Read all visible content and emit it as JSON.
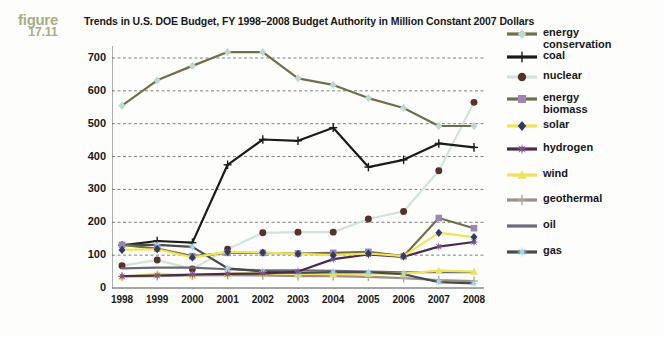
{
  "figure": {
    "word": "figure",
    "number": "17.11"
  },
  "title": "Trends in U.S. DOE Budget, FY 1998–2008 Budget Authority in Million Constant 2007 Dollars",
  "chart_data": {
    "type": "line",
    "title": "Trends in U.S. DOE Budget, FY 1998–2008 Budget Authority in Million Constant 2007 Dollars",
    "xlabel": "",
    "ylabel": "",
    "ylim": [
      0,
      700
    ],
    "yticks": [
      0,
      100,
      200,
      300,
      400,
      500,
      600,
      700
    ],
    "grid": true,
    "legend_position": "right",
    "categories": [
      "1998",
      "1999",
      "2000",
      "2001",
      "2002",
      "2003",
      "2004",
      "2005",
      "2006",
      "2007",
      "2008"
    ],
    "series": [
      {
        "name": "energy conservation",
        "color": "#b9dcd2",
        "line_color": "#6f7049",
        "marker": "diamond",
        "values": [
          555,
          632,
          676,
          718,
          718,
          638,
          618,
          578,
          548,
          493,
          493
        ]
      },
      {
        "name": "coal",
        "color": "#1b1b1b",
        "line_color": "#1b1b1b",
        "marker": "plus",
        "values": [
          130,
          143,
          138,
          375,
          452,
          448,
          488,
          368,
          390,
          440,
          428
        ]
      },
      {
        "name": "nuclear energy",
        "color": "#5a3028",
        "line_color": "#cfe5dc",
        "marker": "circle",
        "values": [
          68,
          85,
          58,
          118,
          168,
          170,
          170,
          210,
          233,
          357,
          565
        ]
      },
      {
        "name": "biomass",
        "color": "#9b86b4",
        "line_color": "#6f7049",
        "marker": "square",
        "values": [
          131,
          120,
          97,
          107,
          107,
          105,
          107,
          110,
          97,
          213,
          182
        ]
      },
      {
        "name": "solar",
        "color": "#2e3a72",
        "line_color": "#f2e451",
        "marker": "diamond",
        "values": [
          116,
          118,
          93,
          110,
          108,
          104,
          100,
          105,
          97,
          168,
          155
        ]
      },
      {
        "name": "hydrogen",
        "color": "#7b4f8e",
        "line_color": "#4a2c46",
        "marker": "star",
        "values": [
          36,
          38,
          41,
          43,
          44,
          50,
          88,
          102,
          95,
          126,
          140
        ]
      },
      {
        "name": "wind",
        "color": "#f0e05a",
        "line_color": "#f0e05a",
        "marker": "triangle",
        "values": [
          33,
          44,
          38,
          44,
          44,
          44,
          42,
          44,
          44,
          53,
          50
        ]
      },
      {
        "name": "geothermal",
        "color": "#b2a5a0",
        "line_color": "#9a8f8a",
        "marker": "plus",
        "values": [
          35,
          36,
          38,
          39,
          38,
          36,
          36,
          34,
          30,
          24,
          21
        ]
      },
      {
        "name": "oil",
        "color": "#6b6b7a",
        "line_color": "#6b6b7a",
        "marker": "line",
        "values": [
          60,
          62,
          62,
          57,
          54,
          54,
          52,
          50,
          48,
          48,
          48
        ]
      },
      {
        "name": "gas",
        "color": "#9fd8e6",
        "line_color": "#4a4a4a",
        "marker": "star",
        "values": [
          131,
          131,
          125,
          60,
          50,
          46,
          48,
          48,
          42,
          18,
          14
        ]
      }
    ]
  },
  "legend": {
    "items": [
      {
        "label": "energy\nconservation",
        "label_line1": "energy",
        "label_line2": "conservation",
        "key": "energy-conservation"
      },
      {
        "label": "coal",
        "label_line1": "coal",
        "label_line2": "",
        "key": "coal"
      },
      {
        "label": "nuclear",
        "label_line1": "nuclear",
        "label_line2": "",
        "key": "nuclear"
      },
      {
        "label": "energy\nbiomass",
        "label_line1": "energy",
        "label_line2": "biomass",
        "key": "biomass"
      },
      {
        "label": "solar",
        "label_line1": "solar",
        "label_line2": "",
        "key": "solar"
      },
      {
        "label": "hydrogen",
        "label_line1": "hydrogen",
        "label_line2": "",
        "key": "hydrogen"
      },
      {
        "label": "wind",
        "label_line1": "wind",
        "label_line2": "",
        "key": "wind"
      },
      {
        "label": "geothermal",
        "label_line1": "geothermal",
        "label_line2": "",
        "key": "geothermal"
      },
      {
        "label": "oil",
        "label_line1": "oil",
        "label_line2": "",
        "key": "oil"
      },
      {
        "label": "gas",
        "label_line1": "gas",
        "label_line2": "",
        "key": "gas"
      }
    ]
  }
}
